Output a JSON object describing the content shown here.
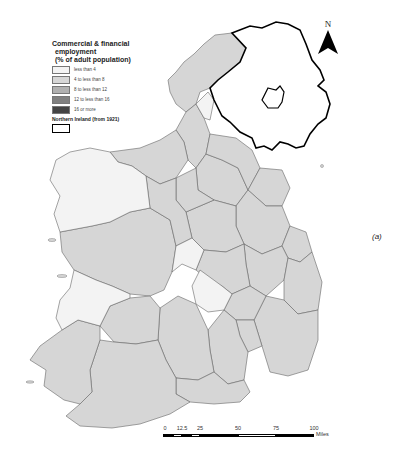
{
  "legend": {
    "title_line1": "Commercial & financial",
    "title_line2": "employment",
    "title_line3": "(% of adult population)",
    "items": [
      {
        "label": "less than 4",
        "color": "#f3f3f3"
      },
      {
        "label": "4 to less than 8",
        "color": "#d6d6d6"
      },
      {
        "label": "8 to less than 12",
        "color": "#b0b0b0"
      },
      {
        "label": "12 to less than 16",
        "color": "#808080"
      },
      {
        "label": "16 or more",
        "color": "#444444"
      }
    ],
    "northern_ireland_label": "Northern Ireland (from 1921)"
  },
  "north_arrow": {
    "letter": "N"
  },
  "panel_label": "(a)",
  "scale_bar": {
    "ticks": [
      "0",
      "12.5",
      "25",
      "50",
      "75",
      "100"
    ],
    "units": "Miles"
  },
  "colors": {
    "low": "#f3f3f3",
    "mid": "#d6d6d6",
    "border": "#555555",
    "ni_border": "#000000"
  }
}
